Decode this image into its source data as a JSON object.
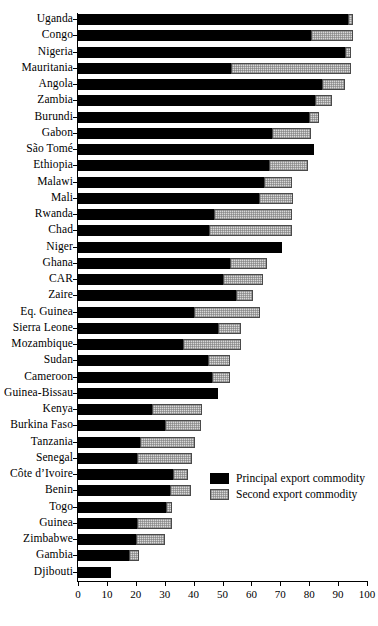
{
  "chart_data": {
    "type": "bar",
    "orientation": "horizontal",
    "stacked": true,
    "title": "",
    "subtitle": "",
    "xlabel": "",
    "ylabel": "",
    "xlim": [
      0,
      100
    ],
    "xticks": [
      0,
      10,
      20,
      30,
      40,
      50,
      60,
      70,
      80,
      90,
      100
    ],
    "grid": false,
    "legend_position": "center-right",
    "categories": [
      "Uganda",
      "Congo",
      "Nigeria",
      "Mauritania",
      "Angola",
      "Zambia",
      "Burundi",
      "Gabon",
      "São Tomé",
      "Ethiopia",
      "Malawi",
      "Mali",
      "Rwanda",
      "Chad",
      "Niger",
      "Ghana",
      "CAR",
      "Zaire",
      "Eq. Guinea",
      "Sierra Leone",
      "Mozambique",
      "Sudan",
      "Cameroon",
      "Guinea-Bissau",
      "Kenya",
      "Burkina Faso",
      "Tanzania",
      "Senegal",
      "Côte d’Ivoire",
      "Benin",
      "Togo",
      "Guinea",
      "Zimbabwe",
      "Gambia",
      "Djibouti"
    ],
    "series": [
      {
        "name": "Principal export commodity",
        "color": "#000000",
        "values": [
          93.5,
          80.5,
          92.5,
          53.0,
          84.5,
          82.0,
          80.0,
          67.0,
          81.5,
          66.0,
          64.5,
          62.5,
          47.0,
          45.5,
          70.5,
          52.5,
          50.0,
          54.5,
          40.0,
          48.5,
          36.5,
          45.0,
          46.5,
          48.5,
          25.5,
          30.0,
          21.5,
          20.5,
          33.0,
          32.0,
          30.5,
          20.5,
          20.0,
          17.5,
          11.5
        ]
      },
      {
        "name": "Second export commodity",
        "color": "#d8d8d8",
        "values": [
          1.5,
          14.5,
          2.0,
          41.5,
          8.0,
          6.0,
          3.5,
          13.5,
          0.0,
          13.5,
          9.5,
          12.0,
          27.0,
          28.5,
          0.0,
          13.0,
          14.0,
          6.0,
          23.0,
          8.0,
          20.0,
          7.5,
          6.0,
          0.0,
          17.5,
          12.5,
          19.0,
          19.0,
          5.0,
          7.0,
          2.0,
          12.0,
          10.0,
          3.5,
          0.0
        ]
      }
    ],
    "totals": [
      95.0,
      95.0,
      94.5,
      94.5,
      92.5,
      88.0,
      83.5,
      80.5,
      81.5,
      79.5,
      74.0,
      74.5,
      74.0,
      74.0,
      70.5,
      65.5,
      64.0,
      60.5,
      63.0,
      56.5,
      56.5,
      52.5,
      52.5,
      48.5,
      43.0,
      42.5,
      40.5,
      39.5,
      38.0,
      39.0,
      32.5,
      32.5,
      30.0,
      21.0,
      11.5
    ]
  },
  "axis": {
    "tick_labels": [
      "0",
      "10",
      "20",
      "30",
      "40",
      "50",
      "60",
      "70",
      "80",
      "90",
      "100"
    ]
  },
  "legend": {
    "items": [
      {
        "label": "Principal export commodity",
        "swatch": "black-solid-swatch"
      },
      {
        "label": "Second export commodity",
        "swatch": "gray-hatched-swatch"
      }
    ]
  }
}
